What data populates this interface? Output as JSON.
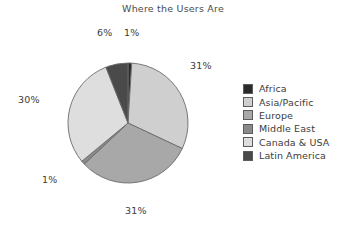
{
  "chart_data": {
    "type": "pie",
    "title": "Where the Users Are",
    "xlabel": "",
    "ylabel": "",
    "legend_position": "right",
    "grid": false,
    "start_angle_deg": 0,
    "direction": "clockwise",
    "categories": [
      "Africa",
      "Asia/Pacific",
      "Europe",
      "Middle East",
      "Canada & USA",
      "Latin America"
    ],
    "values": [
      1,
      31,
      31,
      1,
      30,
      6
    ],
    "value_unit": "%",
    "data_labels": [
      "1%",
      "31%",
      "31%",
      "1%",
      "30%",
      "6%"
    ],
    "slices": [
      {
        "label": "Africa",
        "value": 1,
        "display": "1%",
        "color": "#2b2b2b"
      },
      {
        "label": "Asia/Pacific",
        "value": 31,
        "display": "31%",
        "color": "#cfcfcf"
      },
      {
        "label": "Europe",
        "value": 31,
        "display": "31%",
        "color": "#a8a8a8"
      },
      {
        "label": "Middle East",
        "value": 1,
        "display": "1%",
        "color": "#8a8a8a"
      },
      {
        "label": "Canada & USA",
        "value": 30,
        "display": "30%",
        "color": "#dedede"
      },
      {
        "label": "Latin America",
        "value": 6,
        "display": "6%",
        "color": "#4a4a4a"
      }
    ]
  },
  "legend": {
    "items": [
      {
        "label": "Africa",
        "color": "#2b2b2b"
      },
      {
        "label": "Asia/Pacific",
        "color": "#cfcfcf"
      },
      {
        "label": "Europe",
        "color": "#a8a8a8"
      },
      {
        "label": "Middle East",
        "color": "#8a8a8a"
      },
      {
        "label": "Canada & USA",
        "color": "#dedede"
      },
      {
        "label": "Latin America",
        "color": "#4a4a4a"
      }
    ]
  },
  "style": {
    "slice_outline": "#6b6b6b",
    "background": "#ffffff",
    "text": "#3c3c3c"
  }
}
